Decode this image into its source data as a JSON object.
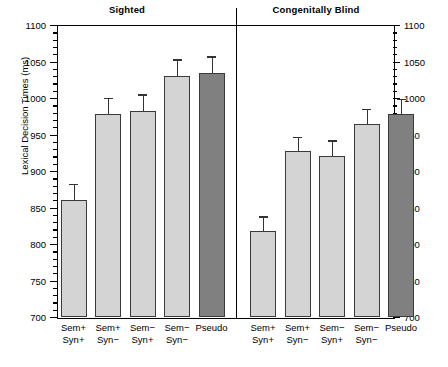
{
  "chart_data": {
    "type": "bar",
    "title": "",
    "xlabel": "",
    "ylabel": "Lexical Decision Times (ms)",
    "ylim": [
      700,
      1100
    ],
    "ytick_labels": [
      "700",
      "750",
      "800",
      "850",
      "900",
      "950",
      "1000",
      "1050",
      "1100"
    ],
    "ytick_values": [
      700,
      750,
      800,
      850,
      900,
      950,
      1000,
      1050,
      1100
    ],
    "minor_tick_step": 10,
    "grid": false,
    "legend": "none",
    "panels": [
      {
        "name": "Sighted",
        "categories": [
          "Sem+\nSyn+",
          "Sem+\nSyn−",
          "Sem−\nSyn+",
          "Sem−\nSyn−",
          "Pseudo"
        ],
        "category_lines": [
          [
            "Sem+",
            "Syn+"
          ],
          [
            "Sem+",
            "Syn−"
          ],
          [
            "Sem−",
            "Syn+"
          ],
          [
            "Sem−",
            "Syn−"
          ],
          [
            "Pseudo",
            ""
          ]
        ],
        "values": [
          860,
          978,
          982,
          1030,
          1034
        ],
        "errors": [
          22,
          22,
          23,
          23,
          23
        ],
        "colors": [
          "#d4d4d4",
          "#d4d4d4",
          "#d4d4d4",
          "#d4d4d4",
          "#808080"
        ]
      },
      {
        "name": "Congenitally Blind",
        "categories": [
          "Sem+\nSyn+",
          "Sem+\nSyn−",
          "Sem−\nSyn+",
          "Sem−\nSyn−",
          "Pseudo"
        ],
        "category_lines": [
          [
            "Sem+",
            "Syn+"
          ],
          [
            "Sem+",
            "Syn−"
          ],
          [
            "Sem−",
            "Syn+"
          ],
          [
            "Sem−",
            "Syn−"
          ],
          [
            "Pseudo",
            ""
          ]
        ],
        "values": [
          818,
          927,
          921,
          964,
          978
        ],
        "errors": [
          20,
          20,
          21,
          21,
          21
        ],
        "colors": [
          "#d4d4d4",
          "#d4d4d4",
          "#d4d4d4",
          "#d4d4d4",
          "#808080"
        ]
      }
    ]
  },
  "panel_titles": {
    "left": "Sighted",
    "right": "Congenitally Blind"
  }
}
